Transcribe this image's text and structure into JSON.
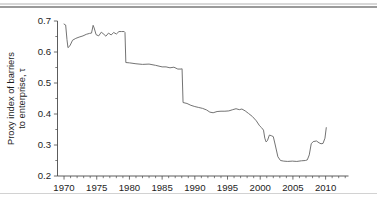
{
  "figure": {
    "background_color": "#ffffff",
    "line_color": "#6b6b6b",
    "axis_color": "#4a4a4a",
    "text_color": "#1d1d1d",
    "caption_fragment": ""
  },
  "chart_data": {
    "type": "line",
    "title": "",
    "xlabel": "",
    "ylabel_line1": "Proxy index of barriers",
    "ylabel_line2": "to enterprise, τ",
    "ylabel": "Proxy index of barriers to enterprise, τ",
    "xlim": [
      1969.0,
      2013.5
    ],
    "ylim": [
      0.2,
      0.7
    ],
    "grid": false,
    "legend": null,
    "xticks": [
      1970,
      1975,
      1980,
      1985,
      1990,
      1995,
      2000,
      2005,
      2010
    ],
    "xtick_labels": [
      "1970",
      "1975",
      "1980",
      "1985",
      "1990",
      "1995",
      "2000",
      "2005",
      "2010"
    ],
    "xticks_minor_step": 1,
    "yticks": [
      0.2,
      0.3,
      0.4,
      0.5,
      0.6,
      0.7
    ],
    "ytick_labels": [
      "0.2",
      "0.3",
      "0.4",
      "0.5",
      "0.6",
      "0.7"
    ],
    "yticks_minor": [
      0.25,
      0.35,
      0.45,
      0.55,
      0.65
    ],
    "series": [
      {
        "name": "Proxy index of barriers to enterprise",
        "x": [
          1970.0,
          1970.25,
          1970.45,
          1970.6,
          1970.9,
          1971.3,
          1971.8,
          1972.3,
          1972.9,
          1973.4,
          1973.9,
          1974.2,
          1974.45,
          1974.6,
          1974.9,
          1975.3,
          1975.7,
          1976.1,
          1976.4,
          1976.8,
          1977.2,
          1977.6,
          1978.0,
          1978.4,
          1978.8,
          1979.2,
          1979.32,
          1979.45,
          1980.0,
          1981.0,
          1982.0,
          1983.0,
          1984.0,
          1985.0,
          1985.6,
          1986.2,
          1986.8,
          1987.4,
          1987.9,
          1988.05,
          1988.2,
          1988.8,
          1989.4,
          1990.0,
          1990.6,
          1991.2,
          1991.8,
          1992.3,
          1992.8,
          1993.4,
          1994.0,
          1994.6,
          1995.2,
          1995.8,
          1996.3,
          1996.8,
          1997.2,
          1997.7,
          1998.2,
          1998.8,
          1999.4,
          1999.9,
          2000.2,
          2000.5,
          2000.7,
          2000.9,
          2001.1,
          2001.4,
          2001.7,
          2002.0,
          2002.3,
          2002.7,
          2003.1,
          2003.6,
          2004.2,
          2004.9,
          2005.6,
          2006.3,
          2006.9,
          2007.2,
          2007.5,
          2007.8,
          2008.1,
          2008.6,
          2009.0,
          2009.3,
          2009.6,
          2009.9,
          2010.1
        ],
        "y": [
          0.69,
          0.687,
          0.64,
          0.614,
          0.62,
          0.638,
          0.644,
          0.648,
          0.652,
          0.657,
          0.66,
          0.661,
          0.686,
          0.678,
          0.656,
          0.652,
          0.664,
          0.657,
          0.651,
          0.661,
          0.655,
          0.663,
          0.658,
          0.666,
          0.666,
          0.666,
          0.663,
          0.566,
          0.565,
          0.562,
          0.56,
          0.561,
          0.557,
          0.552,
          0.552,
          0.549,
          0.551,
          0.545,
          0.545,
          0.546,
          0.437,
          0.434,
          0.428,
          0.424,
          0.421,
          0.418,
          0.413,
          0.406,
          0.404,
          0.408,
          0.409,
          0.409,
          0.41,
          0.414,
          0.417,
          0.414,
          0.416,
          0.41,
          0.402,
          0.392,
          0.378,
          0.362,
          0.356,
          0.348,
          0.322,
          0.31,
          0.314,
          0.332,
          0.33,
          0.327,
          0.3,
          0.262,
          0.25,
          0.248,
          0.247,
          0.248,
          0.247,
          0.249,
          0.25,
          0.252,
          0.268,
          0.304,
          0.311,
          0.313,
          0.307,
          0.304,
          0.305,
          0.322,
          0.356
        ]
      }
    ]
  }
}
